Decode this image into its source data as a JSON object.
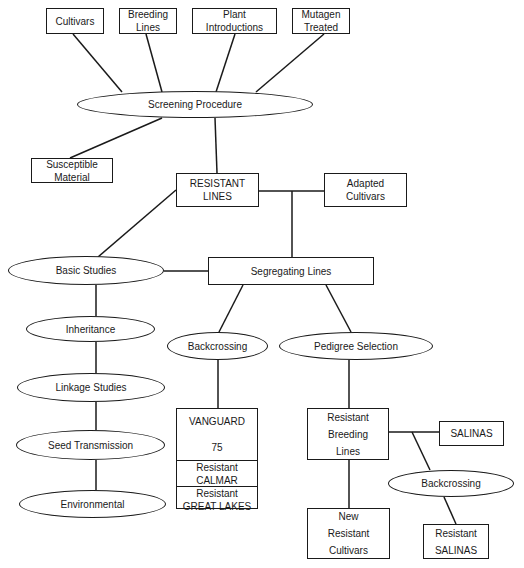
{
  "diagram": {
    "sources": [
      {
        "id": "cultivars",
        "lines": [
          "Cultivars"
        ]
      },
      {
        "id": "breeding-lines",
        "lines": [
          "Breeding",
          "Lines"
        ]
      },
      {
        "id": "plant-introductions",
        "lines": [
          "Plant",
          "Introductions"
        ]
      },
      {
        "id": "mutagen-treated",
        "lines": [
          "Mutagen",
          "Treated"
        ]
      }
    ],
    "screening": "Screening Procedure",
    "susceptible": [
      "Susceptible",
      "Material"
    ],
    "resistant_lines": [
      "RESISTANT",
      "LINES"
    ],
    "adapted_cultivars": [
      "Adapted",
      "Cultivars"
    ],
    "segregating_lines": "Segregating Lines",
    "basic_studies": {
      "title": "Basic Studies",
      "items": [
        "Inheritance",
        "Linkage Studies",
        "Seed Transmission",
        "Environmental"
      ]
    },
    "backcrossing": "Backcrossing",
    "backcrossing_results": [
      {
        "lines": [
          "VANGUARD",
          "75"
        ]
      },
      {
        "lines": [
          "Resistant",
          "CALMAR"
        ]
      },
      {
        "lines": [
          "Resistant",
          "GREAT LAKES"
        ]
      }
    ],
    "pedigree_selection": "Pedigree Selection",
    "resistant_breeding_lines": [
      "Resistant",
      "Breeding",
      "Lines"
    ],
    "salinas": "SALINAS",
    "backcrossing_2": "Backcrossing",
    "new_resistant_cultivars": [
      "New",
      "Resistant",
      "Cultivars"
    ],
    "resistant_salinas": [
      "Resistant",
      "SALINAS"
    ]
  }
}
